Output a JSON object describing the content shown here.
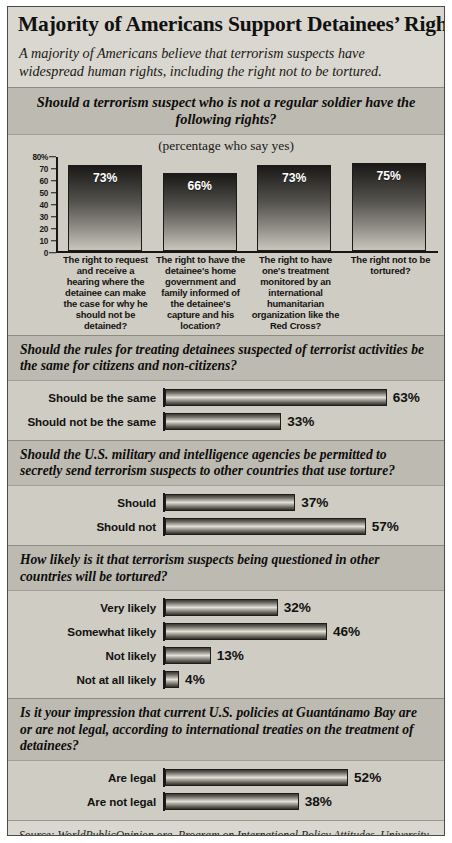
{
  "header": {
    "title": "Majority of Americans Support Detainees’ Rights",
    "subtitle": "A majority of Americans believe that terrorism suspects have widespread human rights, including the right not to be tortured."
  },
  "source": {
    "text": "Source: WorldPublicOpinion.org, Program on International Policy Attitudes, University of Maryland"
  },
  "chart_data": [
    {
      "type": "bar",
      "orientation": "vertical",
      "title": "Should a terrorism suspect who is not a regular soldier have the following rights?",
      "subtitle": "(percentage who say yes)",
      "xlabel": "",
      "ylabel": "",
      "ylim": [
        0,
        80
      ],
      "yticks": [
        "80%",
        "70",
        "60",
        "50",
        "40",
        "30",
        "20",
        "10",
        "0"
      ],
      "ytick_values": [
        80,
        70,
        60,
        50,
        40,
        30,
        20,
        10,
        0
      ],
      "grid": false,
      "legend": "none",
      "categories": [
        "The right to request and receive a hearing where the detainee can make the case for why he should not be detained?",
        "The right to have the detainee's home government and family informed of the detainee's capture and his location?",
        "The right to have one's treatment monitored by an international humanitarian organization like the Red Cross?",
        "The right not to be tortured?"
      ],
      "values": [
        73,
        66,
        73,
        75
      ],
      "value_labels": [
        "73%",
        "66%",
        "73%",
        "75%"
      ]
    },
    {
      "type": "bar",
      "orientation": "horizontal",
      "title": "Should the rules for treating detainees suspected of terrorist activities be the same for citizens and non-citizens?",
      "xlabel": "",
      "ylabel": "",
      "xlim": [
        0,
        100
      ],
      "grid": false,
      "legend": "none",
      "categories": [
        "Should be the same",
        "Should not be the same"
      ],
      "values": [
        63,
        33
      ],
      "value_labels": [
        "63%",
        "33%"
      ]
    },
    {
      "type": "bar",
      "orientation": "horizontal",
      "title": "Should the U.S. military and intelligence agencies be permitted to secretly send terrorism suspects to other countries that use torture?",
      "xlabel": "",
      "ylabel": "",
      "xlim": [
        0,
        100
      ],
      "grid": false,
      "legend": "none",
      "categories": [
        "Should",
        "Should not"
      ],
      "values": [
        37,
        57
      ],
      "value_labels": [
        "37%",
        "57%"
      ]
    },
    {
      "type": "bar",
      "orientation": "horizontal",
      "title": "How likely is it that terrorism suspects being questioned in other countries will be tortured?",
      "xlabel": "",
      "ylabel": "",
      "xlim": [
        0,
        100
      ],
      "grid": false,
      "legend": "none",
      "categories": [
        "Very likely",
        "Somewhat likely",
        "Not likely",
        "Not at all likely"
      ],
      "values": [
        32,
        46,
        13,
        4
      ],
      "value_labels": [
        "32%",
        "46%",
        "13%",
        "4%"
      ]
    },
    {
      "type": "bar",
      "orientation": "horizontal",
      "title": "Is it your impression that current U.S. policies at Guantánamo Bay are or are not legal, according to international treaties on the treatment of detainees?",
      "xlabel": "",
      "ylabel": "",
      "xlim": [
        0,
        100
      ],
      "grid": false,
      "legend": "none",
      "categories": [
        "Are legal",
        "Are not legal"
      ],
      "values": [
        52,
        38
      ],
      "value_labels": [
        "52%",
        "38%"
      ]
    }
  ],
  "colors": {
    "page_background": "#ffffff",
    "panel_background": "#cfccc4",
    "band_background": "#d9d7d0",
    "section_header_background": "#bdbab2",
    "bar_dark": "#1b1a18",
    "bar_light": "#e2dfd7",
    "text": "#111110",
    "border": "#4a4a46"
  }
}
